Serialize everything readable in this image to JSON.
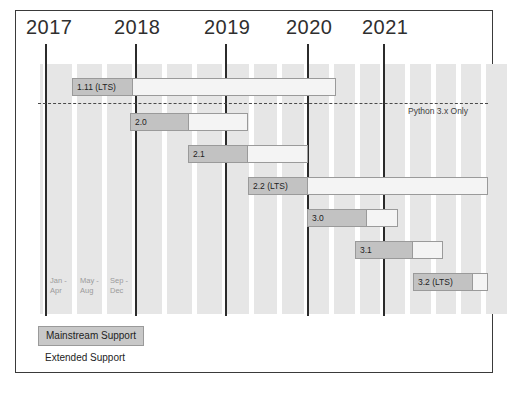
{
  "chart_data": {
    "type": "bar",
    "xlabel": "",
    "ylabel": "",
    "grid": true,
    "legend_position": "bottom-left",
    "xlim": [
      2017.0,
      2021.9
    ],
    "axis_years": [
      "2017",
      "2018",
      "2019",
      "2020",
      "2021"
    ],
    "year_tick_x": [
      45,
      135,
      225,
      307,
      383
    ],
    "sub_period_labels": [
      "Jan -\nApr",
      "May -\nAug",
      "Sep -\nDec"
    ],
    "annotation": "Python 3.x Only",
    "series": [
      {
        "name": "Mainstream Support",
        "color": "#c2c2c2"
      },
      {
        "name": "Extended Support",
        "color": "#f4f4f4"
      }
    ],
    "releases": [
      {
        "label": "1.11 (LTS)",
        "mainstream_start": 72,
        "mainstream_end": 133,
        "extended_end": 336,
        "top": 78
      },
      {
        "label": "2.0",
        "mainstream_start": 130,
        "mainstream_end": 189,
        "extended_end": 248,
        "top": 113
      },
      {
        "label": "2.1",
        "mainstream_start": 188,
        "mainstream_end": 248,
        "extended_end": 308,
        "top": 145
      },
      {
        "label": "2.2 (LTS)",
        "mainstream_start": 248,
        "mainstream_end": 308,
        "extended_end": 488,
        "top": 177
      },
      {
        "label": "3.0",
        "mainstream_start": 307,
        "mainstream_end": 367,
        "extended_end": 398,
        "top": 209
      },
      {
        "label": "3.1",
        "mainstream_start": 355,
        "mainstream_end": 413,
        "extended_end": 443,
        "top": 241
      },
      {
        "label": "3.2 (LTS)",
        "mainstream_start": 413,
        "mainstream_end": 473,
        "extended_end": 488,
        "top": 273
      }
    ]
  },
  "axis": {
    "years": [
      {
        "label": "2017",
        "label_x": 26,
        "rule_x": 45
      },
      {
        "label": "2018",
        "label_x": 114,
        "rule_x": 135
      },
      {
        "label": "2019",
        "label_x": 204,
        "rule_x": 225
      },
      {
        "label": "2020",
        "label_x": 286,
        "rule_x": 307
      },
      {
        "label": "2021",
        "label_x": 362,
        "rule_x": 383
      }
    ]
  },
  "months": [
    {
      "line1": "Jan -",
      "line2": "Apr",
      "x": 50
    },
    {
      "line1": "May -",
      "line2": "Aug",
      "x": 80
    },
    {
      "line1": "Sep -",
      "line2": "Dec",
      "x": 110
    }
  ],
  "annotation": {
    "text": "Python 3.x Only"
  },
  "legend": {
    "mainstream_label": "Mainstream Support",
    "extended_label": "Extended Support"
  },
  "colors": {
    "mainstream": "#c2c2c2",
    "extended": "#f4f4f4",
    "band": "#e6e6e6",
    "rule": "#2b2b2b",
    "border": "#3a3a3a",
    "text": "#232323",
    "muted": "#9b9b9b"
  }
}
